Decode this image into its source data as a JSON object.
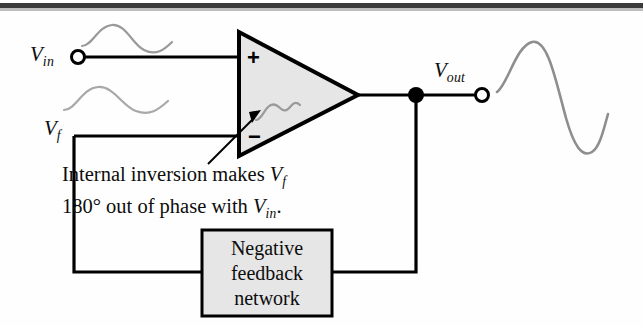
{
  "figure": {
    "background_color": "#fefefe",
    "ink_color": "#0d0d0d",
    "fill_gray": "#e3e3e3",
    "waveform_gray": "#8a8a8a"
  },
  "labels": {
    "vin": {
      "symbol": "V",
      "subscript": "in"
    },
    "vf": {
      "symbol": "V",
      "subscript": "f"
    },
    "vout": {
      "symbol": "V",
      "subscript": "out"
    }
  },
  "opamp": {
    "plus_sign": "+",
    "minus_sign": "−"
  },
  "annotation": {
    "line1_prefix": "Internal inversion makes ",
    "line1_symbol": "V",
    "line1_subscript": "f",
    "line2_prefix": "180° out of phase with ",
    "line2_symbol": "V",
    "line2_subscript": "in",
    "line2_suffix": "."
  },
  "feedback_block": {
    "line1": "Negative",
    "line2": "feedback",
    "line3": "network"
  }
}
